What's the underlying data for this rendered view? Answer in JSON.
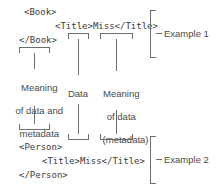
{
  "diagram": {
    "stroke_color": "#6e6e6e",
    "text_color": "#3a3a3a",
    "label_color": "#4a4a4a",
    "background": "#ffffff"
  },
  "example1": {
    "open_tag": "<Book>",
    "inner_line": "<Title>Miss</Title>",
    "close_tag": "</Book>",
    "caption": "Example 1"
  },
  "example2": {
    "open_tag": "<Person>",
    "inner_line": "<Title>Miss</Title>",
    "close_tag": "</Person>",
    "caption": "Example 2"
  },
  "annotations": {
    "left": "Meaning\nof data and\nmetadata",
    "left_line1": "Meaning",
    "left_line2": "of data and",
    "left_line3": "metadata",
    "middle": "Data",
    "right_line1": "Meaning",
    "right_line2": "of data",
    "right_line3": "(metadata)"
  }
}
